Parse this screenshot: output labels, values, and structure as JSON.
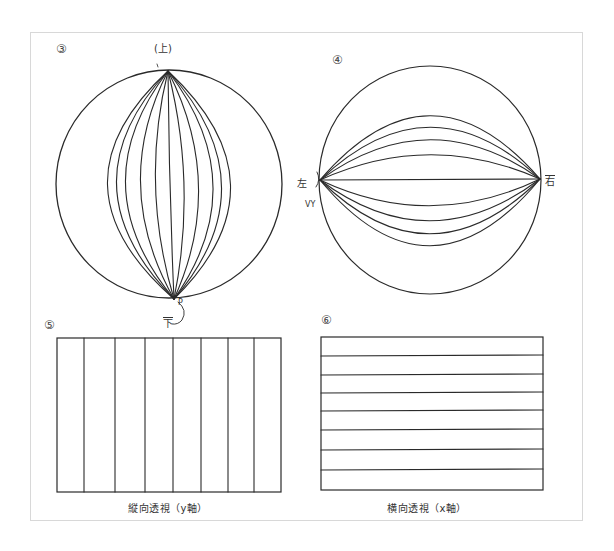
{
  "figure": {
    "panels": [
      {
        "id": "3",
        "number_label": "③",
        "type": "sphere-meridians",
        "top_label": "(上)",
        "bottom_label": "下",
        "bottom_annotation": "P"
      },
      {
        "id": "4",
        "number_label": "④",
        "type": "sphere-horizontal-arcs",
        "left_label": "左",
        "left_annotation": "VY",
        "right_label": "右"
      },
      {
        "id": "5",
        "number_label": "⑤",
        "type": "rectangle-vertical-lines",
        "caption": "縦向透視（y軸）",
        "divisions": 8
      },
      {
        "id": "6",
        "number_label": "⑥",
        "type": "rectangle-horizontal-lines",
        "caption": "横向透視（x軸）",
        "divisions": 8
      }
    ]
  },
  "colors": {
    "line": "#2a2a2a",
    "frame": "#d8d8d8",
    "background": "#ffffff"
  }
}
